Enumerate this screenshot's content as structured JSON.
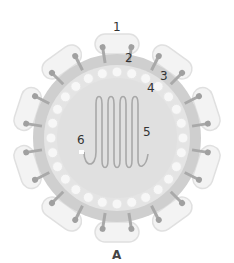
{
  "diagram": {
    "caption": "A",
    "center": {
      "x": 117,
      "y": 138
    },
    "colors": {
      "outer_lobe": "#f3f3f3",
      "outer_lobe_stroke": "#e2e2e2",
      "envelope_ring": "#c8c8c8",
      "matrix_ring": "#e6e6e6",
      "blob": "#f7f7f7",
      "core": "#e2e2e2",
      "spike": "#a9a9a9",
      "rna": "#a8a8a8",
      "label": "#333333"
    },
    "labels": [
      {
        "id": "1",
        "text": "1",
        "x": 113,
        "y": 21
      },
      {
        "id": "2",
        "text": "2",
        "x": 125,
        "y": 52
      },
      {
        "id": "3",
        "text": "3",
        "x": 160,
        "y": 70
      },
      {
        "id": "4",
        "text": "4",
        "x": 147,
        "y": 82
      },
      {
        "id": "5",
        "text": "5",
        "x": 143,
        "y": 126
      },
      {
        "id": "6",
        "text": "6",
        "x": 77,
        "y": 134
      }
    ]
  }
}
